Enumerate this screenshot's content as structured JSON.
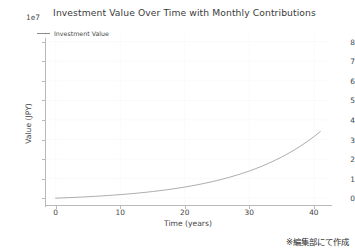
{
  "chart_data": {
    "type": "line",
    "title": "Investment Value Over Time with Monthly Contributions",
    "xlabel": "Time (years)",
    "ylabel": "Value (JPY)",
    "y_exponent_label": "1e7",
    "y_exponent": 10000000,
    "xlim": [
      -1.5,
      42.5
    ],
    "ylim": [
      -0.35,
      8.45
    ],
    "xticks": [
      0,
      10,
      20,
      30,
      40
    ],
    "xtick_labels": [
      "0",
      "10",
      "20",
      "30",
      "40"
    ],
    "yticks": [
      0,
      1,
      2,
      3,
      4,
      5,
      6,
      7,
      8
    ],
    "ytick_labels": [
      "0",
      "1",
      "2",
      "3",
      "4",
      "5",
      "6",
      "7",
      "8"
    ],
    "grid": true,
    "grid_color": "#fafafa",
    "legend_position": "upper left",
    "line_color": "#8a8a8a",
    "line_width": 0.7,
    "series": [
      {
        "name": "Investment Value",
        "x": [
          0,
          1,
          2,
          3,
          4,
          5,
          6,
          7,
          8,
          9,
          10,
          11,
          12,
          13,
          14,
          15,
          16,
          17,
          18,
          19,
          20,
          21,
          22,
          23,
          24,
          25,
          26,
          27,
          28,
          29,
          30,
          31,
          32,
          33,
          34,
          35,
          36,
          37,
          38,
          39,
          40,
          41
        ],
        "values": [
          0.0,
          0.126,
          0.262,
          0.408,
          0.566,
          0.736,
          0.92,
          1.118,
          1.332,
          1.563,
          1.812,
          2.081,
          2.37,
          2.683,
          3.02,
          3.384,
          3.776,
          4.2,
          4.656,
          5.149,
          5.68,
          6.253,
          6.871,
          7.536,
          8.254,
          9.027,
          9.861,
          10.76,
          11.73,
          12.77,
          13.9,
          15.12,
          16.43,
          17.85,
          19.38,
          21.03,
          22.81,
          24.73,
          26.81,
          29.05,
          31.47,
          34.08
        ],
        "values_scaled_note": "values above are in units of 1e6; plotted y = value/10 in 1e7 units"
      }
    ],
    "curve_points_1e7": [
      {
        "year": 0,
        "value": 0.0
      },
      {
        "year": 5,
        "value": 0.25
      },
      {
        "year": 10,
        "value": 0.6
      },
      {
        "year": 15,
        "value": 1.1
      },
      {
        "year": 20,
        "value": 1.75
      },
      {
        "year": 25,
        "value": 2.6
      },
      {
        "year": 30,
        "value": 3.75
      },
      {
        "year": 35,
        "value": 5.3
      },
      {
        "year": 40,
        "value": 7.4
      },
      {
        "year": 41,
        "value": 8.0
      }
    ]
  },
  "credit": {
    "text": "※編集部にて作成"
  },
  "legend": {
    "label": "Investment Value"
  }
}
